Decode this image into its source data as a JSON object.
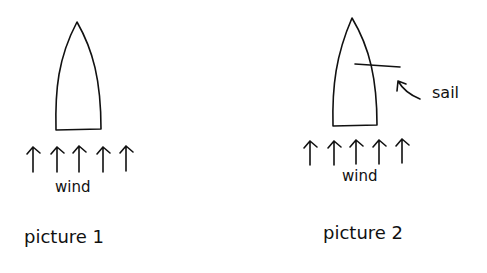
{
  "pictures": [
    {
      "caption": "picture 1",
      "wind_label": "wind",
      "arrow_count": 5,
      "has_sail": false
    },
    {
      "caption": "picture 2",
      "wind_label": "wind",
      "sail_label": "sail",
      "arrow_count": 5,
      "has_sail": true
    }
  ],
  "colors": {
    "ink": "#111111",
    "background": "#ffffff"
  }
}
